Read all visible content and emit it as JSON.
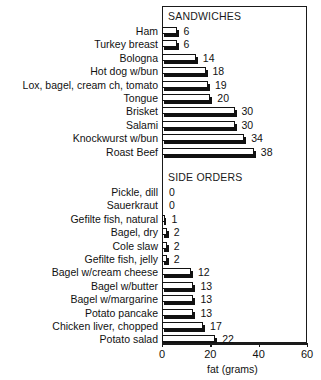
{
  "chart_data": {
    "type": "bar",
    "orientation": "horizontal",
    "title": "",
    "xlabel": "fat (grams)",
    "ylabel": "",
    "xlim": [
      0,
      60
    ],
    "xticks": [
      0,
      20,
      40,
      60
    ],
    "xtick_labels": [
      "0",
      "20",
      "40",
      "60"
    ],
    "grid": false,
    "legend": false,
    "sections": [
      {
        "name": "SANDWICHES",
        "categories": [
          "Ham",
          "Turkey breast",
          "Bologna",
          "Hot dog w/bun",
          "Lox, bagel, cream ch, tomato",
          "Tongue",
          "Brisket",
          "Salami",
          "Knockwurst w/bun",
          "Roast Beef"
        ],
        "values": [
          6,
          6,
          14,
          18,
          19,
          20,
          30,
          30,
          34,
          38
        ]
      },
      {
        "name": "SIDE ORDERS",
        "categories": [
          "Pickle, dill",
          "Sauerkraut",
          "Gefilte fish, natural",
          "Bagel, dry",
          "Cole slaw",
          "Gefilte fish, jelly",
          "Bagel w/cream cheese",
          "Bagel w/butter",
          "Bagel w/margarine",
          "Potato pancake",
          "Chicken liver, chopped",
          "Potato salad"
        ],
        "values": [
          0,
          0,
          1,
          2,
          2,
          2,
          12,
          13,
          13,
          13,
          17,
          22
        ]
      }
    ],
    "categories": [
      "Ham",
      "Turkey breast",
      "Bologna",
      "Hot dog w/bun",
      "Lox, bagel, cream ch, tomato",
      "Tongue",
      "Brisket",
      "Salami",
      "Knockwurst w/bun",
      "Roast Beef",
      "Pickle, dill",
      "Sauerkraut",
      "Gefilte fish, natural",
      "Bagel, dry",
      "Cole slaw",
      "Gefilte fish, jelly",
      "Bagel w/cream cheese",
      "Bagel w/butter",
      "Bagel w/margarine",
      "Potato pancake",
      "Chicken liver, chopped",
      "Potato salad"
    ],
    "values": [
      6,
      6,
      14,
      18,
      19,
      20,
      30,
      30,
      34,
      38,
      0,
      0,
      1,
      2,
      2,
      2,
      12,
      13,
      13,
      13,
      17,
      22
    ],
    "colors": {
      "bar_face": "#ffffff",
      "bar_outline": "#111111",
      "bar_shadow": "#111111",
      "axis": "#1a1a1a",
      "text": "#111111",
      "background": "#ffffff"
    }
  },
  "headings": {
    "sandwiches": "SANDWICHES",
    "side_orders": "SIDE ORDERS"
  },
  "axis": {
    "title": "fat (grams)",
    "ticks": [
      "0",
      "20",
      "40",
      "60"
    ]
  }
}
